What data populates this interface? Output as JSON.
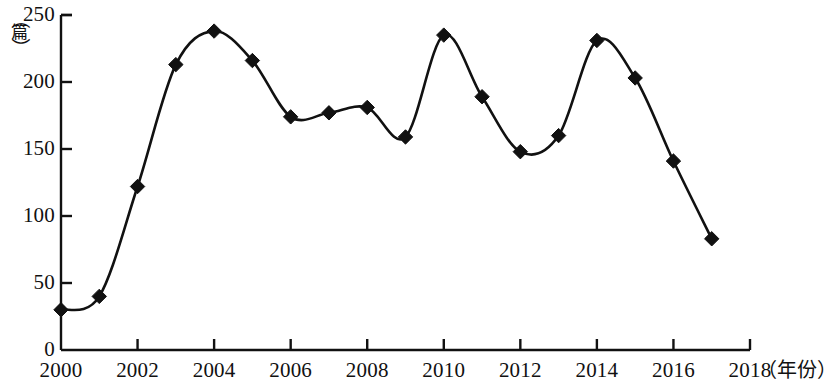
{
  "chart_data": {
    "type": "line",
    "title": "",
    "subtitle": "",
    "xlabel": "（年份）",
    "ylabel": "（篇）",
    "x": [
      2000,
      2001,
      2002,
      2003,
      2004,
      2005,
      2006,
      2007,
      2008,
      2009,
      2010,
      2011,
      2012,
      2013,
      2014,
      2015,
      2016,
      2017
    ],
    "values": [
      30,
      40,
      122,
      213,
      238,
      216,
      174,
      177,
      181,
      159,
      235,
      189,
      148,
      160,
      231,
      203,
      141,
      83
    ],
    "series": [
      {
        "name": "",
        "values": [
          30,
          40,
          122,
          213,
          238,
          216,
          174,
          177,
          181,
          159,
          235,
          189,
          148,
          160,
          231,
          203,
          141,
          83
        ]
      }
    ],
    "xlim": [
      2000,
      2018
    ],
    "ylim": [
      0,
      250
    ],
    "xticks": [
      2000,
      2002,
      2004,
      2006,
      2008,
      2010,
      2012,
      2014,
      2016,
      2018
    ],
    "xtick_labels": [
      "2000",
      "2002",
      "2004",
      "2006",
      "2008",
      "2010",
      "2012",
      "2014",
      "2016",
      "2018"
    ],
    "yticks": [
      0,
      50,
      100,
      150,
      200,
      250
    ],
    "ytick_labels": [
      "0",
      "50",
      "100",
      "150",
      "200",
      "250"
    ],
    "grid": false,
    "legend": false,
    "legend_position": "none",
    "marker": "diamond",
    "line_color": "#111111",
    "marker_color": "#111111",
    "background_color": "#ffffff",
    "smoothing": "spline"
  },
  "axis": {
    "y_unit_open_paren": "（",
    "y_unit_char": "篇",
    "y_unit_close_paren": "）",
    "x_unit": "（年份）"
  }
}
